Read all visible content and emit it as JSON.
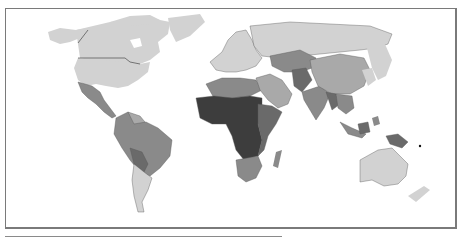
{
  "map": {
    "type": "choropleth",
    "projection": "world",
    "palette": {
      "class_1": "#d2d2d2",
      "class_2": "#a9a9a9",
      "class_3": "#8a8a8a",
      "class_4": "#6a6a6a",
      "class_5": "#3d3d3d",
      "no_data": "#ffffff"
    },
    "regions": [
      {
        "name": "North America (Canada, USA, Greenland)",
        "class": "class_1"
      },
      {
        "name": "Mexico & Central America",
        "class": "class_3"
      },
      {
        "name": "South America (north & Brazil)",
        "class": "class_3"
      },
      {
        "name": "Bolivia / Paraguay",
        "class": "class_4"
      },
      {
        "name": "Argentina / Chile / Uruguay",
        "class": "class_1"
      },
      {
        "name": "Europe",
        "class": "class_1"
      },
      {
        "name": "Russia",
        "class": "class_1"
      },
      {
        "name": "North Africa",
        "class": "class_3"
      },
      {
        "name": "West & Central Africa",
        "class": "class_5"
      },
      {
        "name": "East Africa",
        "class": "class_4"
      },
      {
        "name": "Southern Africa",
        "class": "class_3"
      },
      {
        "name": "Middle East",
        "class": "class_2"
      },
      {
        "name": "Central Asia",
        "class": "class_3"
      },
      {
        "name": "Afghanistan / Pakistan",
        "class": "class_4"
      },
      {
        "name": "India",
        "class": "class_3"
      },
      {
        "name": "China",
        "class": "class_2"
      },
      {
        "name": "Japan / Korea",
        "class": "class_1"
      },
      {
        "name": "Southeast Asia",
        "class": "class_3"
      },
      {
        "name": "Papua New Guinea",
        "class": "class_4"
      },
      {
        "name": "Australia / New Zealand",
        "class": "class_1"
      }
    ]
  }
}
